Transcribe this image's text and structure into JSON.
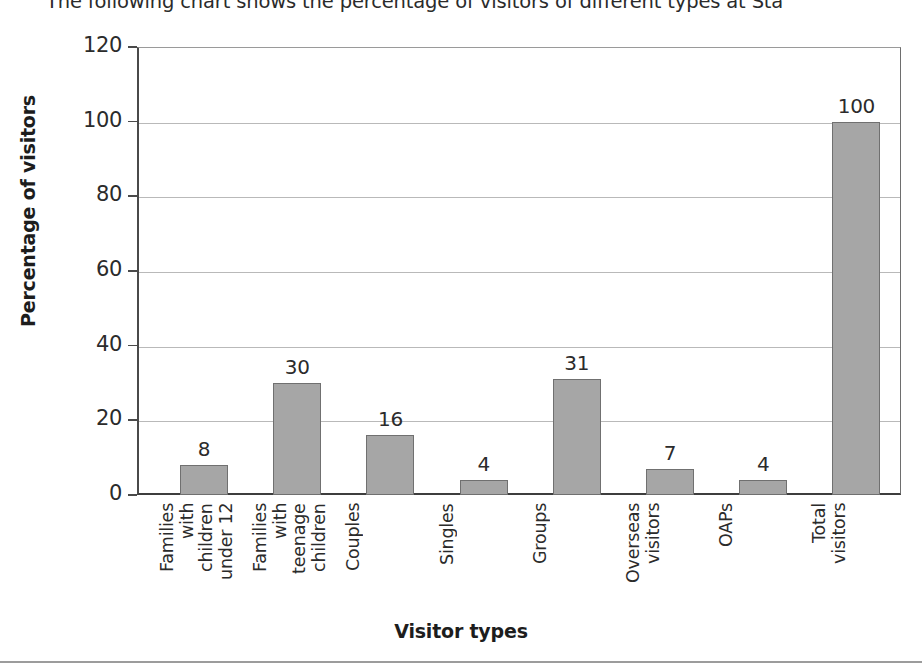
{
  "header": {
    "text": "The following chart shows the percentage of visitors of different types at Sta"
  },
  "chart_data": {
    "type": "bar",
    "title": "",
    "xlabel": "Visitor types",
    "ylabel": "Percentage of visitors",
    "ylim": [
      0,
      120
    ],
    "ytick_step": 20,
    "yticks": [
      0,
      20,
      40,
      60,
      80,
      100,
      120
    ],
    "grid": true,
    "legend": "none",
    "bar_color": "#a6a6a6",
    "bar_border_color": "#707070",
    "categories": [
      "Families with children under 12",
      "Families with teenage children",
      "Couples",
      "Singles",
      "Groups",
      "Overseas visitors",
      "OAPs",
      "Total visitors"
    ],
    "values": [
      8,
      30,
      16,
      4,
      31,
      7,
      4,
      100
    ],
    "value_labels": [
      "8",
      "30",
      "16",
      "4",
      "31",
      "7",
      "4",
      "100"
    ]
  }
}
